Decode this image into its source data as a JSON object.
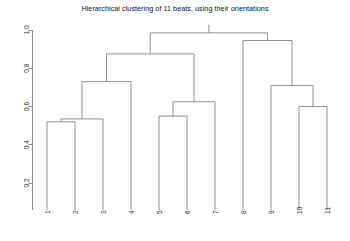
{
  "chart_data": {
    "type": "dendrogram",
    "title": "Hierarchical clustering of 11 beats, using their orientations",
    "xlabel": "",
    "ylabel": "",
    "ylim": [
      0.17,
      1.01
    ],
    "grid": false,
    "legend": null,
    "yticks": [
      "1.0",
      "0.8",
      "0.6",
      "0.4",
      "0.2"
    ],
    "ytick_values": [
      1.0,
      0.8,
      0.6,
      0.4,
      0.2
    ],
    "leaf_labels": [
      "1",
      "2",
      "3",
      "4",
      "5",
      "6",
      "7",
      "8",
      "9",
      "10",
      "11"
    ],
    "leaf_order": [
      1,
      2,
      3,
      4,
      5,
      6,
      7,
      8,
      9,
      10,
      11
    ],
    "merges": [
      {
        "id": "m1",
        "label": "1+2",
        "left": "leaf:1",
        "right": "leaf:2",
        "height": 0.52
      },
      {
        "id": "m2",
        "label": "(1,2)+3",
        "left": "m1",
        "right": "leaf:3",
        "height": 0.535
      },
      {
        "id": "m3",
        "label": "5+6",
        "left": "leaf:5",
        "right": "leaf:6",
        "height": 0.55
      },
      {
        "id": "m4",
        "label": "(5,6)+7",
        "left": "m3",
        "right": "leaf:7",
        "height": 0.625
      },
      {
        "id": "m5",
        "label": "10+11",
        "left": "leaf:10",
        "right": "leaf:11",
        "height": 0.6
      },
      {
        "id": "m6",
        "label": "9+(10,11)",
        "left": "leaf:9",
        "right": "m5",
        "height": 0.71
      },
      {
        "id": "m7",
        "label": "((1,2),3)+4",
        "left": "m2",
        "right": "leaf:4",
        "height": 0.73
      },
      {
        "id": "m8",
        "label": "left+middle",
        "left": "m7",
        "right": "m4",
        "height": 0.875
      },
      {
        "id": "m9",
        "label": "8+(9,(10,11))",
        "left": "leaf:8",
        "right": "m6",
        "height": 0.945
      },
      {
        "id": "m10",
        "label": "root",
        "left": "m8",
        "right": "m9",
        "height": 0.985
      }
    ]
  },
  "plot": {
    "title": "Hierarchical clustering of 11 beats, using their orientations"
  }
}
